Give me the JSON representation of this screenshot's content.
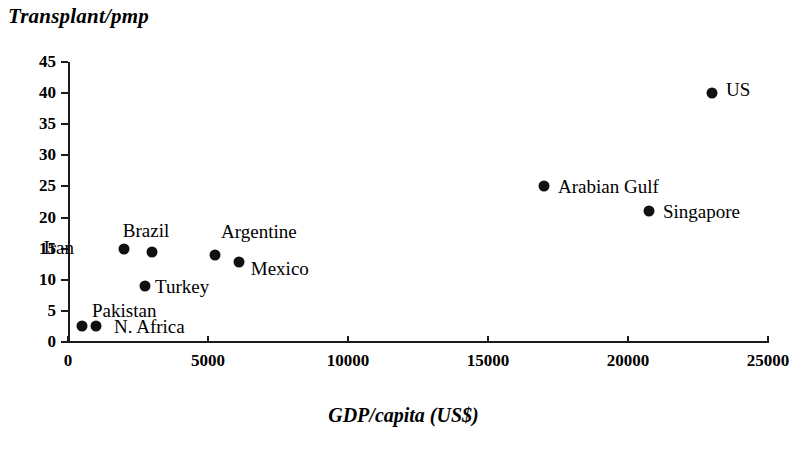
{
  "chart_data": {
    "type": "scatter",
    "title": "",
    "xlabel": "GDP/capita (US$)",
    "ylabel": "Transplant/pmp",
    "xlim": [
      0,
      25000
    ],
    "ylim": [
      0,
      45
    ],
    "grid": false,
    "legend": "none",
    "xticks": [
      "0",
      "5000",
      "10000",
      "15000",
      "20000",
      "25000"
    ],
    "xtick_values": [
      0,
      5000,
      10000,
      15000,
      20000,
      25000
    ],
    "yticks": [
      "0",
      "5",
      "10",
      "15",
      "20",
      "25",
      "30",
      "35",
      "40",
      "45"
    ],
    "ytick_values": [
      0,
      5,
      10,
      15,
      20,
      25,
      30,
      35,
      40,
      45
    ],
    "points": [
      {
        "label": "Pakistan",
        "x": 500,
        "y": 2.5,
        "label_dx": 10,
        "label_dy": -26,
        "label_align": "left"
      },
      {
        "label": "N. Africa",
        "x": 1000,
        "y": 2.5,
        "label_dx": 18,
        "label_dy": -10,
        "label_align": "left"
      },
      {
        "label": "Iran",
        "x": 2000,
        "y": 15,
        "label_dx": -50,
        "label_dy": -12,
        "label_align": "right"
      },
      {
        "label": "Brazil",
        "x": 3000,
        "y": 14.5,
        "label_dx": -6,
        "label_dy": -32,
        "label_align": "center"
      },
      {
        "label": "Turkey",
        "x": 2750,
        "y": 9,
        "label_dx": 10,
        "label_dy": -10,
        "label_align": "left"
      },
      {
        "label": "Argentine",
        "x": 5250,
        "y": 14,
        "label_dx": 6,
        "label_dy": -34,
        "label_align": "left"
      },
      {
        "label": "Mexico",
        "x": 6100,
        "y": 12.8,
        "label_dx": 12,
        "label_dy": -4,
        "label_align": "left"
      },
      {
        "label": "Arabian Gulf",
        "x": 17000,
        "y": 25,
        "label_dx": 14,
        "label_dy": -10,
        "label_align": "left"
      },
      {
        "label": "Singapore",
        "x": 20750,
        "y": 21,
        "label_dx": 14,
        "label_dy": -10,
        "label_align": "left"
      },
      {
        "label": "US",
        "x": 23000,
        "y": 40,
        "label_dx": 14,
        "label_dy": -14,
        "label_align": "left"
      }
    ]
  }
}
